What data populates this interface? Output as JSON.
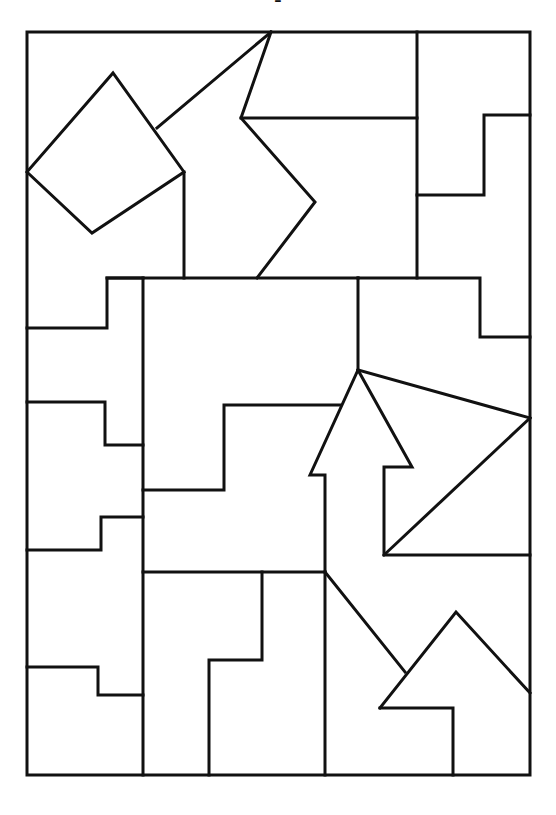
{
  "header": {
    "title_fragment": "- "
  },
  "diagram": {
    "type": "line-puzzle",
    "stroke_color": "#111111",
    "background": "#ffffff",
    "frame": {
      "x1": 27,
      "y1": 32,
      "x2": 530,
      "y2": 775
    },
    "polylines": [
      [
        [
          27,
          32
        ],
        [
          530,
          32
        ],
        [
          530,
          775
        ],
        [
          27,
          775
        ],
        [
          27,
          32
        ]
      ],
      [
        [
          27,
          172
        ],
        [
          113,
          73
        ],
        [
          184,
          172
        ],
        [
          92,
          233
        ],
        [
          27,
          172
        ]
      ],
      [
        [
          157,
          128
        ],
        [
          271,
          32
        ]
      ],
      [
        [
          271,
          32
        ],
        [
          241,
          118
        ],
        [
          315,
          202
        ],
        [
          257,
          278
        ]
      ],
      [
        [
          241,
          118
        ],
        [
          417,
          118
        ]
      ],
      [
        [
          417,
          32
        ],
        [
          417,
          278
        ]
      ],
      [
        [
          417,
          195
        ],
        [
          484,
          195
        ],
        [
          484,
          115
        ],
        [
          530,
          115
        ]
      ],
      [
        [
          184,
          172
        ],
        [
          184,
          278
        ]
      ],
      [
        [
          107,
          278
        ],
        [
          358,
          278
        ]
      ],
      [
        [
          27,
          328
        ],
        [
          107,
          328
        ],
        [
          107,
          278
        ],
        [
          143,
          278
        ]
      ],
      [
        [
          143,
          278
        ],
        [
          143,
          775
        ]
      ],
      [
        [
          358,
          278
        ],
        [
          480,
          278
        ],
        [
          480,
          337
        ],
        [
          530,
          337
        ]
      ],
      [
        [
          358,
          278
        ],
        [
          358,
          370
        ]
      ],
      [
        [
          27,
          402
        ],
        [
          105,
          402
        ],
        [
          105,
          445
        ],
        [
          143,
          445
        ]
      ],
      [
        [
          143,
          490
        ],
        [
          224,
          490
        ],
        [
          224,
          405
        ],
        [
          340,
          405
        ]
      ],
      [
        [
          358,
          370
        ],
        [
          530,
          418
        ]
      ],
      [
        [
          358,
          370
        ],
        [
          310,
          475
        ],
        [
          325,
          475
        ],
        [
          325,
          572
        ]
      ],
      [
        [
          358,
          370
        ],
        [
          412,
          467
        ],
        [
          384,
          467
        ],
        [
          384,
          555
        ],
        [
          530,
          555
        ]
      ],
      [
        [
          384,
          555
        ],
        [
          530,
          418
        ]
      ],
      [
        [
          27,
          550
        ],
        [
          101,
          550
        ],
        [
          101,
          517
        ],
        [
          143,
          517
        ]
      ],
      [
        [
          143,
          572
        ],
        [
          325,
          572
        ]
      ],
      [
        [
          262,
          572
        ],
        [
          262,
          660
        ],
        [
          209,
          660
        ],
        [
          209,
          775
        ]
      ],
      [
        [
          325,
          572
        ],
        [
          325,
          775
        ]
      ],
      [
        [
          325,
          572
        ],
        [
          405,
          672
        ]
      ],
      [
        [
          380,
          708
        ],
        [
          456,
          612
        ],
        [
          530,
          693
        ]
      ],
      [
        [
          380,
          708
        ],
        [
          453,
          708
        ],
        [
          453,
          775
        ]
      ],
      [
        [
          27,
          667
        ],
        [
          98,
          667
        ],
        [
          98,
          695
        ],
        [
          143,
          695
        ]
      ]
    ]
  }
}
